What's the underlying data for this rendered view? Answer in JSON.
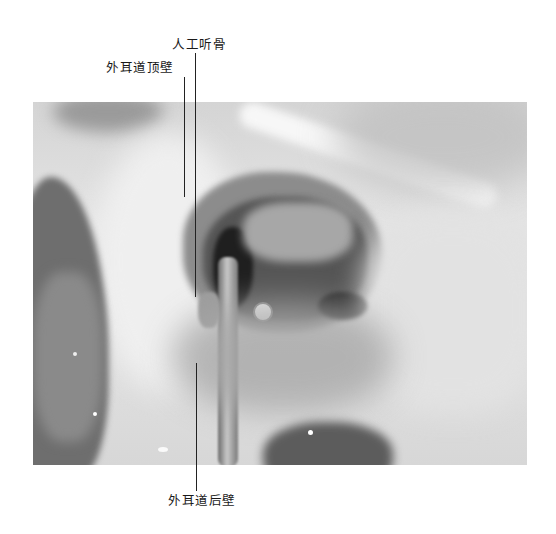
{
  "figure": {
    "labels": [
      {
        "id": "artificial-ossicle",
        "text": "人工听骨"
      },
      {
        "id": "ear-canal-superior-wall",
        "text": "外耳道顶壁"
      },
      {
        "id": "ear-canal-posterior-wall",
        "text": "外耳道后壁"
      }
    ],
    "colors": {
      "background": "#ffffff",
      "leader_line": "#222222",
      "label_text": "#1a1a1a"
    }
  }
}
